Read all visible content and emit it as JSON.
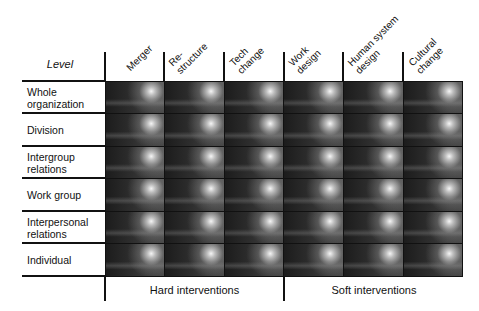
{
  "diagram": {
    "corner_label": "Level",
    "columns": [
      {
        "line1": "Merger",
        "line2": ""
      },
      {
        "line1": "Re-",
        "line2": "structure"
      },
      {
        "line1": "Tech",
        "line2": "change"
      },
      {
        "line1": "Work",
        "line2": "design"
      },
      {
        "line1": "Human system",
        "line2": "design"
      },
      {
        "line1": "Cultural",
        "line2": "change"
      }
    ],
    "rows": [
      {
        "line1": "Whole",
        "line2": "organization"
      },
      {
        "line1": "Division",
        "line2": ""
      },
      {
        "line1": "Intergroup",
        "line2": "relations"
      },
      {
        "line1": "Work group",
        "line2": ""
      },
      {
        "line1": "Interpersonal",
        "line2": "relations"
      },
      {
        "line1": "Individual",
        "line2": ""
      }
    ],
    "groups": [
      {
        "label": "Hard interventions",
        "columns": "Merger, Re-structure, Tech change"
      },
      {
        "label": "Soft interventions",
        "columns": "Work design, Human system design, Cultural change"
      }
    ],
    "cell_fill": "dark grey photographic texture with bright spot (all 36 cells identical)"
  }
}
